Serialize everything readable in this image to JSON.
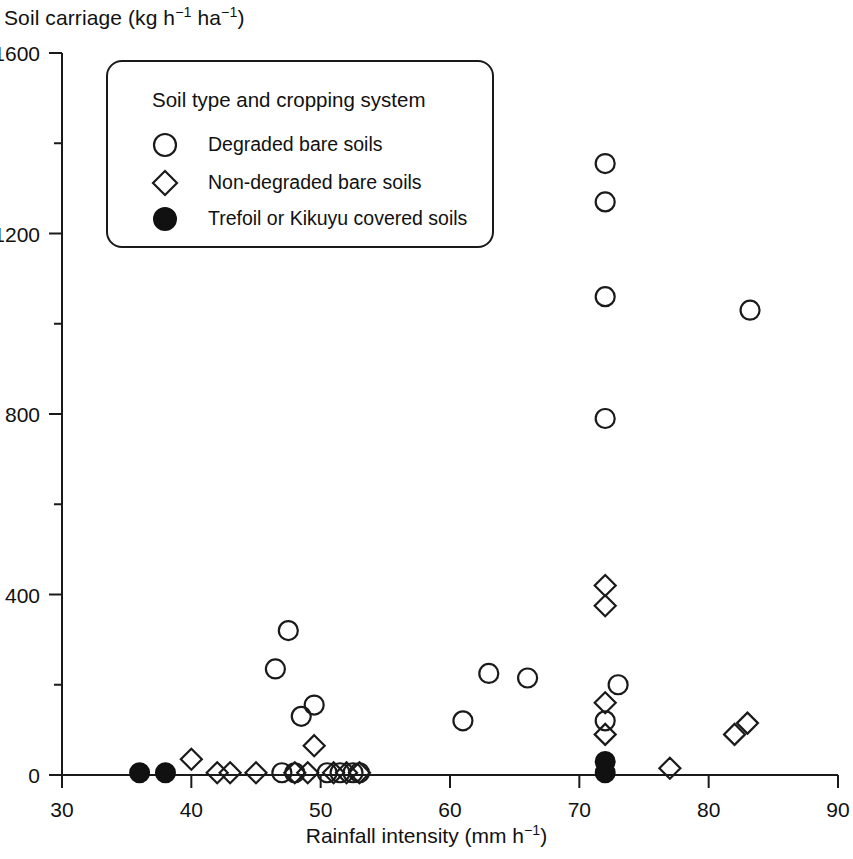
{
  "chart_data": {
    "type": "scatter",
    "title": "",
    "ylabel_parts": {
      "pre": "Soil carriage (kg h",
      "sup1": "−1",
      "mid": " ha",
      "sup2": "−1",
      "post": ")"
    },
    "xlabel_parts": {
      "pre": "Rainfall intensity (mm h",
      "sup1": "−1",
      "post": ")"
    },
    "ylabel": "Soil carriage (kg h−1 ha−1)",
    "xlabel": "Rainfall intensity (mm h−1)",
    "xlim": [
      30,
      90
    ],
    "ylim": [
      0,
      1600
    ],
    "xticks": [
      30,
      40,
      50,
      60,
      70,
      80,
      90
    ],
    "yticks": [
      0,
      400,
      800,
      1200,
      1600
    ],
    "y_minor_ticks": [
      200,
      600,
      1000,
      1400
    ],
    "x_tick_labels": [
      "30",
      "40",
      "50",
      "60",
      "70",
      "80",
      "90"
    ],
    "y_tick_labels": [
      "0",
      "400",
      "800",
      "1200",
      "1600"
    ],
    "grid": false,
    "legend_position": "upper-left-inside",
    "legend": {
      "title": "Soil type and cropping system",
      "entries": [
        {
          "marker": "open-circle",
          "label": "Degraded bare soils"
        },
        {
          "marker": "open-diamond",
          "label": "Non-degraded bare soils"
        },
        {
          "marker": "filled-circle",
          "label": "Trefoil or Kikuyu covered soils"
        }
      ]
    },
    "series": [
      {
        "name": "Degraded bare soils",
        "marker": "open-circle",
        "points": [
          [
            47.5,
            320
          ],
          [
            46.5,
            235
          ],
          [
            48.5,
            130
          ],
          [
            49.5,
            155
          ],
          [
            61.0,
            120
          ],
          [
            63.0,
            225
          ],
          [
            66.0,
            215
          ],
          [
            72.0,
            1355
          ],
          [
            72.0,
            1270
          ],
          [
            72.0,
            1060
          ],
          [
            72.0,
            790
          ],
          [
            72.0,
            120
          ],
          [
            73.0,
            200
          ],
          [
            83.2,
            1030
          ],
          [
            47.0,
            5
          ],
          [
            48.0,
            5
          ],
          [
            50.5,
            5
          ],
          [
            51.5,
            5
          ],
          [
            52.5,
            5
          ],
          [
            53.0,
            5
          ]
        ]
      },
      {
        "name": "Non-degraded bare soils",
        "marker": "open-diamond",
        "points": [
          [
            40.0,
            35
          ],
          [
            42.0,
            5
          ],
          [
            43.0,
            5
          ],
          [
            45.0,
            5
          ],
          [
            48.0,
            5
          ],
          [
            49.0,
            5
          ],
          [
            51.0,
            5
          ],
          [
            52.0,
            5
          ],
          [
            53.0,
            5
          ],
          [
            49.5,
            65
          ],
          [
            72.0,
            420
          ],
          [
            72.0,
            375
          ],
          [
            72.0,
            160
          ],
          [
            72.0,
            90
          ],
          [
            77.0,
            15
          ],
          [
            82.0,
            90
          ],
          [
            83.0,
            115
          ]
        ]
      },
      {
        "name": "Trefoil or Kikuyu covered soils",
        "marker": "filled-circle",
        "points": [
          [
            36.0,
            5
          ],
          [
            38.0,
            5
          ],
          [
            72.0,
            30
          ],
          [
            72.0,
            5
          ]
        ]
      }
    ]
  }
}
